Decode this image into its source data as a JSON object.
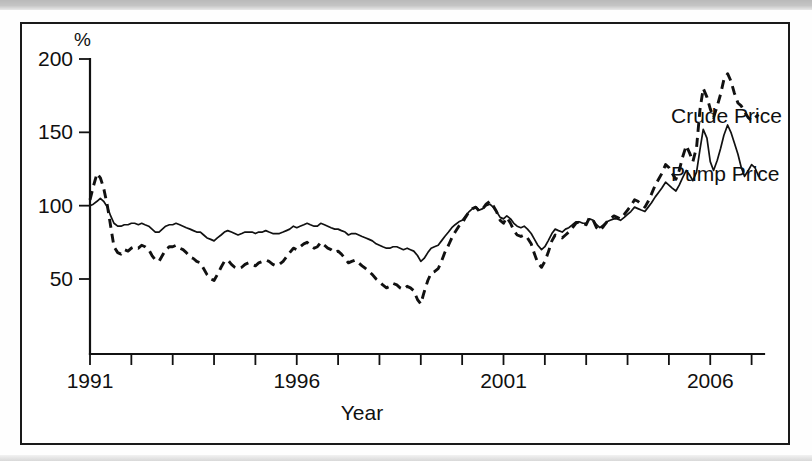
{
  "figure": {
    "unit_label": "%",
    "x_axis_title": "Year",
    "legend": {
      "crude_label": "Crude Price",
      "pump_label": "Pump Price"
    }
  },
  "chart_data": {
    "type": "line",
    "title": "",
    "subtitle": "",
    "xlabel": "Year",
    "ylabel": "%",
    "unit": "%",
    "xlim": [
      1991,
      2007.3
    ],
    "ylim": [
      0,
      210
    ],
    "y_axis_range_drawn": [
      25,
      200
    ],
    "grid": false,
    "legend_position": "right-inline-annotations",
    "x_tick_values": [
      1991,
      1992,
      1993,
      1994,
      1995,
      1996,
      1997,
      1998,
      1999,
      2000,
      2001,
      2002,
      2003,
      2004,
      2005,
      2006,
      2007
    ],
    "x_tick_labels": [
      "1991",
      "",
      "",
      "",
      "",
      "1996",
      "",
      "",
      "",
      "",
      "2001",
      "",
      "",
      "",
      "",
      "2006",
      ""
    ],
    "y_tick_values": [
      50,
      100,
      150,
      200
    ],
    "y_tick_labels": [
      "50",
      "100",
      "150",
      "200"
    ],
    "line_styles": {
      "Crude Price": "dashed",
      "Pump Price": "solid"
    },
    "colors": {
      "Crude Price": "#111111",
      "Pump Price": "#111111"
    },
    "x": [
      1991.0,
      1991.08,
      1991.17,
      1991.25,
      1991.33,
      1991.42,
      1991.5,
      1991.58,
      1991.67,
      1991.75,
      1991.83,
      1991.92,
      1992.0,
      1992.08,
      1992.17,
      1992.25,
      1992.33,
      1992.42,
      1992.5,
      1992.58,
      1992.67,
      1992.75,
      1992.83,
      1992.92,
      1993.0,
      1993.08,
      1993.17,
      1993.25,
      1993.33,
      1993.42,
      1993.5,
      1993.58,
      1993.67,
      1993.75,
      1993.83,
      1993.92,
      1994.0,
      1994.08,
      1994.17,
      1994.25,
      1994.33,
      1994.42,
      1994.5,
      1994.58,
      1994.67,
      1994.75,
      1994.83,
      1994.92,
      1995.0,
      1995.08,
      1995.17,
      1995.25,
      1995.33,
      1995.42,
      1995.5,
      1995.58,
      1995.67,
      1995.75,
      1995.83,
      1995.92,
      1996.0,
      1996.08,
      1996.17,
      1996.25,
      1996.33,
      1996.42,
      1996.5,
      1996.58,
      1996.67,
      1996.75,
      1996.83,
      1996.92,
      1997.0,
      1997.08,
      1997.17,
      1997.25,
      1997.33,
      1997.42,
      1997.5,
      1997.58,
      1997.67,
      1997.75,
      1997.83,
      1997.92,
      1998.0,
      1998.08,
      1998.17,
      1998.25,
      1998.33,
      1998.42,
      1998.5,
      1998.58,
      1998.67,
      1998.75,
      1998.83,
      1998.92,
      1999.0,
      1999.08,
      1999.17,
      1999.25,
      1999.33,
      1999.42,
      1999.5,
      1999.58,
      1999.67,
      1999.75,
      1999.83,
      1999.92,
      2000.0,
      2000.08,
      2000.17,
      2000.25,
      2000.33,
      2000.42,
      2000.5,
      2000.58,
      2000.67,
      2000.75,
      2000.83,
      2000.92,
      2001.0,
      2001.08,
      2001.17,
      2001.25,
      2001.33,
      2001.42,
      2001.5,
      2001.58,
      2001.67,
      2001.75,
      2001.83,
      2001.92,
      2002.0,
      2002.08,
      2002.17,
      2002.25,
      2002.33,
      2002.42,
      2002.5,
      2002.58,
      2002.67,
      2002.75,
      2002.83,
      2002.92,
      2003.0,
      2003.08,
      2003.17,
      2003.25,
      2003.33,
      2003.42,
      2003.5,
      2003.58,
      2003.67,
      2003.75,
      2003.83,
      2003.92,
      2004.0,
      2004.08,
      2004.17,
      2004.25,
      2004.33,
      2004.42,
      2004.5,
      2004.58,
      2004.67,
      2004.75,
      2004.83,
      2004.92,
      2005.0,
      2005.08,
      2005.17,
      2005.25,
      2005.33,
      2005.42,
      2005.5,
      2005.58,
      2005.67,
      2005.75,
      2005.83,
      2005.92,
      2006.0,
      2006.08,
      2006.17,
      2006.25,
      2006.33,
      2006.42,
      2006.5,
      2006.58,
      2006.67,
      2006.75,
      2006.83,
      2006.92,
      2007.0,
      2007.08,
      2007.17
    ],
    "series": [
      {
        "name": "Crude Price",
        "style": "dashed",
        "values": [
          104,
          113,
          122,
          119,
          112,
          100,
          86,
          72,
          68,
          67,
          70,
          69,
          71,
          72,
          71,
          73,
          72,
          70,
          66,
          63,
          62,
          66,
          70,
          72,
          72,
          73,
          71,
          70,
          68,
          65,
          64,
          62,
          61,
          57,
          53,
          50,
          49,
          53,
          58,
          62,
          63,
          60,
          58,
          57,
          58,
          60,
          61,
          60,
          59,
          61,
          62,
          63,
          62,
          60,
          59,
          60,
          62,
          65,
          68,
          71,
          70,
          72,
          74,
          75,
          73,
          71,
          72,
          75,
          73,
          71,
          70,
          68,
          69,
          67,
          64,
          61,
          62,
          63,
          61,
          59,
          57,
          55,
          53,
          50,
          48,
          46,
          44,
          45,
          47,
          46,
          44,
          43,
          45,
          44,
          42,
          36,
          33,
          41,
          49,
          54,
          55,
          57,
          62,
          68,
          73,
          78,
          82,
          86,
          88,
          92,
          96,
          98,
          99,
          96,
          98,
          101,
          103,
          100,
          96,
          90,
          88,
          92,
          88,
          83,
          80,
          79,
          80,
          78,
          74,
          67,
          61,
          58,
          62,
          68,
          76,
          80,
          79,
          78,
          80,
          82,
          85,
          88,
          89,
          88,
          87,
          92,
          90,
          85,
          83,
          86,
          89,
          91,
          93,
          92,
          91,
          94,
          97,
          100,
          104,
          103,
          101,
          99,
          103,
          108,
          114,
          118,
          122,
          128,
          126,
          122,
          118,
          124,
          133,
          141,
          136,
          130,
          140,
          165,
          180,
          174,
          166,
          160,
          168,
          176,
          186,
          190,
          185,
          177,
          170,
          168,
          164,
          160,
          158,
          160,
          162
        ]
      },
      {
        "name": "Pump Price",
        "style": "solid",
        "values": [
          100,
          101,
          103,
          105,
          103,
          99,
          93,
          88,
          86,
          86,
          87,
          87,
          88,
          88,
          87,
          88,
          87,
          86,
          84,
          82,
          82,
          84,
          86,
          87,
          87,
          88,
          87,
          86,
          85,
          84,
          83,
          82,
          82,
          80,
          78,
          77,
          76,
          78,
          80,
          82,
          83,
          82,
          81,
          80,
          81,
          82,
          82,
          82,
          81,
          82,
          82,
          83,
          82,
          81,
          81,
          81,
          82,
          83,
          84,
          86,
          85,
          86,
          87,
          88,
          87,
          86,
          86,
          88,
          87,
          86,
          85,
          84,
          84,
          83,
          82,
          80,
          81,
          81,
          80,
          79,
          78,
          77,
          76,
          74,
          73,
          72,
          71,
          71,
          72,
          72,
          71,
          70,
          71,
          70,
          69,
          66,
          62,
          64,
          68,
          71,
          72,
          73,
          76,
          79,
          82,
          85,
          87,
          89,
          90,
          93,
          96,
          98,
          99,
          97,
          98,
          100,
          101,
          99,
          96,
          92,
          91,
          93,
          91,
          88,
          86,
          85,
          86,
          84,
          81,
          77,
          73,
          70,
          72,
          76,
          81,
          84,
          83,
          82,
          84,
          85,
          87,
          89,
          89,
          88,
          88,
          91,
          90,
          87,
          85,
          87,
          89,
          90,
          91,
          91,
          90,
          92,
          94,
          96,
          99,
          98,
          97,
          96,
          99,
          102,
          106,
          109,
          112,
          116,
          114,
          112,
          110,
          114,
          119,
          124,
          121,
          117,
          123,
          138,
          152,
          146,
          130,
          124,
          131,
          139,
          148,
          155,
          150,
          143,
          135,
          126,
          120,
          124,
          128,
          126,
          120
        ]
      }
    ]
  }
}
